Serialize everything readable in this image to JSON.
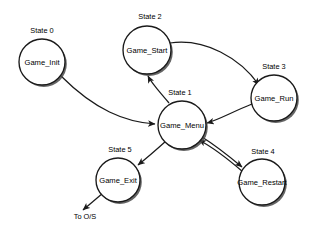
{
  "diagram": {
    "type": "state-machine",
    "title": "",
    "background_color": "#ffffff",
    "stroke_color": "#1a1a1a",
    "shadow_color": "#4a4a4a",
    "states": [
      {
        "index_label": "State 0",
        "name": "Game_Init",
        "cx": 42,
        "cy": 62,
        "r": 23,
        "label_x": 42,
        "label_y": 33
      },
      {
        "index_label": "State 2",
        "name": "Game_Start",
        "cx": 147,
        "cy": 50,
        "r": 24,
        "label_x": 150,
        "label_y": 19
      },
      {
        "index_label": "State 3",
        "name": "Game_Run",
        "cx": 274,
        "cy": 98,
        "r": 23,
        "label_x": 274,
        "label_y": 69
      },
      {
        "index_label": "State 1",
        "name": "Game_Menu",
        "cx": 182,
        "cy": 125,
        "r": 24,
        "label_x": 180,
        "label_y": 95
      },
      {
        "index_label": "State 5",
        "name": "Game_Exit",
        "cx": 118,
        "cy": 180,
        "r": 22,
        "label_x": 120,
        "label_y": 152
      },
      {
        "index_label": "State 4",
        "name": "Game_Restart",
        "cx": 262,
        "cy": 182,
        "r": 23,
        "label_x": 263,
        "label_y": 154
      }
    ],
    "terminals": [
      {
        "name": "To O/S",
        "x": 85,
        "y": 219
      }
    ],
    "transitions": [
      {
        "from": "Game_Init",
        "to": "Game_Menu",
        "path": "M 61,76 C 95,110 125,122 155,124"
      },
      {
        "from": "Game_Menu",
        "to": "Game_Start",
        "path": "M 169,103 C 160,92 152,84 148,76"
      },
      {
        "from": "Game_Start",
        "to": "Game_Run",
        "path": "M 170,43 C 205,38 240,58 259,85"
      },
      {
        "from": "Game_Run",
        "to": "Game_Menu",
        "path": "M 252,104 C 232,112 218,120 207,123"
      },
      {
        "from": "Game_Menu",
        "to": "Game_Restart",
        "path": "M 202,137 C 218,147 230,157 242,167"
      },
      {
        "from": "Game_Restart",
        "to": "Game_Menu",
        "path": "M 243,172 C 228,159 214,148 199,140"
      },
      {
        "from": "Game_Menu",
        "to": "Game_Exit",
        "path": "M 166,141 C 156,150 148,157 138,165"
      },
      {
        "from": "Game_Exit",
        "to": "To O/S",
        "path": "M 103,193 C 96,199 90,204 83,210"
      }
    ]
  }
}
